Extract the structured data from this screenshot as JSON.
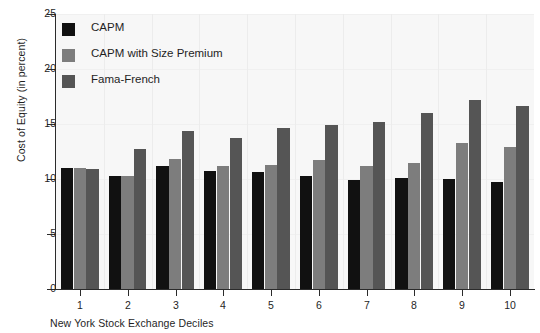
{
  "chart_data": {
    "type": "bar",
    "title": "",
    "xlabel": "New York Stock Exchange Deciles",
    "ylabel": "Cost of Equity (in percent)",
    "categories": [
      "1",
      "2",
      "3",
      "4",
      "5",
      "6",
      "7",
      "8",
      "9",
      "10"
    ],
    "series": [
      {
        "name": "CAPM",
        "color": "#111111",
        "values": [
          11.0,
          10.3,
          11.2,
          10.7,
          10.6,
          10.3,
          9.9,
          10.1,
          10.0,
          9.7
        ]
      },
      {
        "name": "CAPM with Size Premium",
        "color": "#7d7d7d",
        "values": [
          11.0,
          10.3,
          11.8,
          11.2,
          11.3,
          11.7,
          11.2,
          11.5,
          13.3,
          12.9
        ]
      },
      {
        "name": "Fama-French",
        "color": "#555555",
        "values": [
          10.9,
          12.7,
          14.4,
          13.7,
          14.6,
          14.9,
          15.2,
          16.0,
          17.2,
          16.6
        ]
      }
    ],
    "ylim": [
      0,
      25
    ],
    "y_ticks": [
      0,
      5,
      10,
      15,
      20,
      25
    ],
    "y_tick_labels": [
      "0",
      "5",
      "10",
      "15",
      "20",
      "25"
    ],
    "grid": "vertical-faint",
    "legend_position": "top-left",
    "plot_background": "#f7f7f7",
    "axis_color": "#2b2b2b"
  }
}
